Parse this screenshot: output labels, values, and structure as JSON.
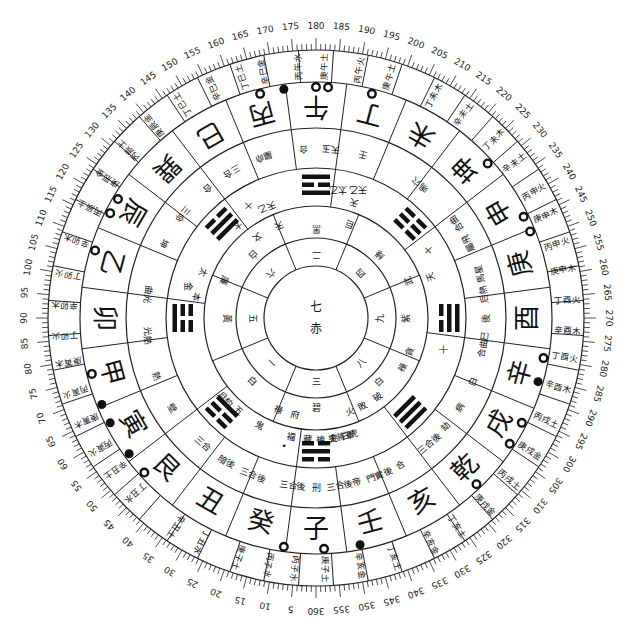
{
  "diagram": {
    "type": "luopan-compass",
    "center": {
      "number": "七",
      "color": "赤"
    },
    "degree_labels": [
      5,
      10,
      15,
      20,
      25,
      30,
      35,
      40,
      45,
      50,
      55,
      60,
      65,
      70,
      75,
      80,
      85,
      90,
      95,
      100,
      105,
      110,
      115,
      120,
      125,
      130,
      135,
      140,
      145,
      150,
      155,
      160,
      165,
      170,
      175,
      180,
      185,
      190,
      195,
      200,
      205,
      210,
      215,
      220,
      225,
      230,
      235,
      240,
      245,
      250,
      255,
      260,
      265,
      270,
      275,
      280,
      285,
      290,
      295,
      300,
      305,
      310,
      315,
      320,
      325,
      330,
      335,
      340,
      345,
      350,
      355,
      360
    ],
    "mountains": [
      {
        "name": "子",
        "deg": 0
      },
      {
        "name": "癸",
        "deg": 15
      },
      {
        "name": "丑",
        "deg": 30
      },
      {
        "name": "艮",
        "deg": 45
      },
      {
        "name": "寅",
        "deg": 60
      },
      {
        "name": "甲",
        "deg": 75
      },
      {
        "name": "卯",
        "deg": 90
      },
      {
        "name": "乙",
        "deg": 105
      },
      {
        "name": "辰",
        "deg": 120
      },
      {
        "name": "巽",
        "deg": 135
      },
      {
        "name": "巳",
        "deg": 150
      },
      {
        "name": "丙",
        "deg": 165
      },
      {
        "name": "午",
        "deg": 180
      },
      {
        "name": "丁",
        "deg": 195
      },
      {
        "name": "未",
        "deg": 210
      },
      {
        "name": "坤",
        "deg": 225
      },
      {
        "name": "申",
        "deg": 240
      },
      {
        "name": "庚",
        "deg": 255
      },
      {
        "name": "酉",
        "deg": 270
      },
      {
        "name": "辛",
        "deg": 285
      },
      {
        "name": "戌",
        "deg": 300
      },
      {
        "name": "乾",
        "deg": 315
      },
      {
        "name": "亥",
        "deg": 330
      },
      {
        "name": "壬",
        "deg": 345
      }
    ],
    "outer_fen_jin": [
      {
        "text": "丙子水",
        "deg": 5
      },
      {
        "text": "庚子土",
        "deg": 358
      },
      {
        "text": "辛亥金",
        "deg": 350
      },
      {
        "text": "丁亥土",
        "deg": 342
      },
      {
        "text": "辛亥金",
        "deg": 333
      },
      {
        "text": "丁亥土",
        "deg": 326
      },
      {
        "text": "庚戌金",
        "deg": 318
      },
      {
        "text": "丙戌土",
        "deg": 310
      },
      {
        "text": "庚戌金",
        "deg": 302
      },
      {
        "text": "丙戌土",
        "deg": 294
      },
      {
        "text": "辛酉木",
        "deg": 286
      },
      {
        "text": "丁酉火",
        "deg": 279
      },
      {
        "text": "辛酉木",
        "deg": 273
      },
      {
        "text": "丁酉火",
        "deg": 266
      },
      {
        "text": "庚申木",
        "deg": 259
      },
      {
        "text": "丙申火",
        "deg": 253
      },
      {
        "text": "庚申木",
        "deg": 246
      },
      {
        "text": "丙申火",
        "deg": 240
      },
      {
        "text": "辛未土",
        "deg": 232
      },
      {
        "text": "丁未木",
        "deg": 225
      },
      {
        "text": "辛未土",
        "deg": 216
      },
      {
        "text": "丁未木",
        "deg": 208
      },
      {
        "text": "庚午土",
        "deg": 197
      },
      {
        "text": "丙午火",
        "deg": 190
      },
      {
        "text": "庚午土",
        "deg": 182
      },
      {
        "text": "丙午水",
        "deg": 176
      },
      {
        "text": "辛巳金",
        "deg": 168
      },
      {
        "text": "丁巳土",
        "deg": 163
      },
      {
        "text": "辛巳金",
        "deg": 156
      },
      {
        "text": "丁巳土",
        "deg": 148
      },
      {
        "text": "庚辰金",
        "deg": 140
      },
      {
        "text": "丙辰土",
        "deg": 132
      },
      {
        "text": "庚辰金",
        "deg": 124
      },
      {
        "text": "丙辰土",
        "deg": 116
      },
      {
        "text": "辛卯木",
        "deg": 108
      },
      {
        "text": "丁卯火",
        "deg": 100
      },
      {
        "text": "辛卯木",
        "deg": 93
      },
      {
        "text": "丁卯火",
        "deg": 86
      },
      {
        "text": "庚寅木",
        "deg": 80
      },
      {
        "text": "丙寅火",
        "deg": 73
      },
      {
        "text": "庚寅木",
        "deg": 66
      },
      {
        "text": "丙寅火",
        "deg": 59
      },
      {
        "text": "辛丑土",
        "deg": 53
      },
      {
        "text": "丁丑水",
        "deg": 46
      },
      {
        "text": "辛丑土",
        "deg": 34
      },
      {
        "text": "丁丑水",
        "deg": 27
      },
      {
        "text": "庚子土",
        "deg": 18
      },
      {
        "text": "丙子水",
        "deg": 11
      }
    ],
    "markers": [
      {
        "deg": 172,
        "type": "solid"
      },
      {
        "deg": 166,
        "type": "open"
      },
      {
        "deg": 180,
        "type": "open"
      },
      {
        "deg": 183,
        "type": "open"
      },
      {
        "deg": 194,
        "type": "open"
      },
      {
        "deg": 228,
        "type": "open"
      },
      {
        "deg": 244,
        "type": "open"
      },
      {
        "deg": 248,
        "type": "open"
      },
      {
        "deg": 280,
        "type": "open"
      },
      {
        "deg": 286,
        "type": "solid"
      },
      {
        "deg": 297,
        "type": "open"
      },
      {
        "deg": 303,
        "type": "open"
      },
      {
        "deg": 316,
        "type": "open"
      },
      {
        "deg": 349,
        "type": "solid"
      },
      {
        "deg": 358,
        "type": "open"
      },
      {
        "deg": 8,
        "type": "open"
      },
      {
        "deg": 48,
        "type": "open"
      },
      {
        "deg": 54,
        "type": "solid"
      },
      {
        "deg": 63,
        "type": "solid"
      },
      {
        "deg": 68,
        "type": "solid"
      },
      {
        "deg": 76,
        "type": "open"
      },
      {
        "deg": 107,
        "type": "open"
      },
      {
        "deg": 117,
        "type": "open"
      },
      {
        "deg": 121,
        "type": "open"
      }
    ],
    "star_ring": [
      {
        "text": "三合後",
        "deg": 8
      },
      {
        "text": "刑",
        "deg": 0
      },
      {
        "text": "三合後",
        "deg": 352
      },
      {
        "text": "帝",
        "deg": 346
      },
      {
        "text": "門實後",
        "deg": 338
      },
      {
        "text": "合",
        "deg": 330
      },
      {
        "text": "三合後",
        "deg": 318
      },
      {
        "text": "劫",
        "deg": 310
      },
      {
        "text": "病",
        "deg": 302
      },
      {
        "text": "白",
        "deg": 292
      },
      {
        "text": "合曲巳",
        "deg": 279
      },
      {
        "text": "後",
        "deg": 270
      },
      {
        "text": "后熱",
        "deg": 262
      },
      {
        "text": "馬星",
        "deg": 255
      },
      {
        "text": "屬飛",
        "deg": 244
      },
      {
        "text": "合曲",
        "deg": 236
      },
      {
        "text": "嗚穴",
        "deg": 218
      },
      {
        "text": "壬",
        "deg": 196
      },
      {
        "text": "天玉",
        "deg": 185
      },
      {
        "text": "合",
        "deg": 176
      },
      {
        "text": "屬命",
        "deg": 162
      },
      {
        "text": "三合",
        "deg": 150
      },
      {
        "text": "合",
        "deg": 140
      },
      {
        "text": "三命",
        "deg": 128
      },
      {
        "text": "坤",
        "deg": 116
      },
      {
        "text": "曲光",
        "deg": 98
      },
      {
        "text": "光熱",
        "deg": 84
      },
      {
        "text": "熱",
        "deg": 70
      },
      {
        "text": "壁",
        "deg": 58
      },
      {
        "text": "三合",
        "deg": 42
      },
      {
        "text": "暗後",
        "deg": 32
      },
      {
        "text": "三合後",
        "deg": 22
      }
    ],
    "inner_ring_text": [
      {
        "text": "福",
        "deg": 12
      },
      {
        "text": "藏",
        "deg": 4
      },
      {
        "text": "金",
        "deg": 352
      },
      {
        "text": "白虎",
        "deg": 344
      },
      {
        "text": "天將軍",
        "deg": 348
      },
      {
        "text": "神",
        "deg": 358
      },
      {
        "text": "鬼",
        "deg": 28
      },
      {
        "text": "五",
        "deg": 40
      },
      {
        "text": "月約",
        "deg": 48
      },
      {
        "text": "本",
        "deg": 100
      },
      {
        "text": "太",
        "deg": 112
      },
      {
        "text": "太",
        "deg": 140
      },
      {
        "text": "天乙",
        "deg": 156
      },
      {
        "text": "天",
        "deg": 198
      },
      {
        "text": "天",
        "deg": 250
      }
    ],
    "trigrams": [
      {
        "deg": 180,
        "name": "離",
        "lines": [
          1,
          0,
          1
        ],
        "label": "天乙 太乙"
      },
      {
        "deg": 225,
        "name": "坤",
        "lines": [
          0,
          0,
          0
        ],
        "label": "十"
      },
      {
        "deg": 270,
        "name": "兌",
        "lines": [
          0,
          1,
          1
        ],
        "label": "十"
      },
      {
        "deg": 315,
        "name": "乾",
        "lines": [
          1,
          1,
          1
        ],
        "label": ""
      },
      {
        "deg": 0,
        "name": "坎",
        "lines": [
          0,
          1,
          0
        ],
        "label": "•"
      },
      {
        "deg": 45,
        "name": "艮",
        "lines": [
          1,
          0,
          0
        ],
        "label": ""
      },
      {
        "deg": 90,
        "name": "震",
        "lines": [
          0,
          0,
          1
        ],
        "label": "金"
      },
      {
        "deg": 135,
        "name": "巽",
        "lines": [
          1,
          1,
          0
        ],
        "label": "十"
      }
    ],
    "luoshu_ring": [
      {
        "text": "三",
        "deg": 0
      },
      {
        "text": "碧",
        "deg": 0,
        "r": "outer"
      },
      {
        "text": "八",
        "deg": 315
      },
      {
        "text": "白",
        "deg": 315,
        "r": "outer"
      },
      {
        "text": "九",
        "deg": 270
      },
      {
        "text": "紫",
        "deg": 270,
        "r": "outer"
      },
      {
        "text": "四",
        "deg": 225
      },
      {
        "text": "綠",
        "deg": 225,
        "r": "outer"
      },
      {
        "text": "二",
        "deg": 180
      },
      {
        "text": "黑",
        "deg": 180,
        "r": "outer"
      },
      {
        "text": "六",
        "deg": 135
      },
      {
        "text": "白",
        "deg": 135,
        "r": "outer"
      },
      {
        "text": "五",
        "deg": 90
      },
      {
        "text": "黃",
        "deg": 90,
        "r": "outer"
      },
      {
        "text": "一",
        "deg": 45
      },
      {
        "text": "白",
        "deg": 45,
        "r": "outer"
      }
    ],
    "gua_ring": [
      {
        "text": "府",
        "deg": 12
      },
      {
        "text": "祿",
        "deg": 22
      },
      {
        "text": "火",
        "deg": 340
      },
      {
        "text": "敗",
        "deg": 332
      },
      {
        "text": "破",
        "deg": 322
      },
      {
        "text": "祿",
        "deg": 300
      },
      {
        "text": "貪",
        "deg": 290
      },
      {
        "text": "武",
        "deg": 248
      },
      {
        "text": "巨",
        "deg": 200
      },
      {
        "text": "文",
        "deg": 144
      },
      {
        "text": "廉",
        "deg": 112
      },
      {
        "text": "天",
        "deg": 158
      }
    ]
  },
  "colors": {
    "ink": "#111111",
    "paper": "#ffffff",
    "rule": "#222222"
  }
}
